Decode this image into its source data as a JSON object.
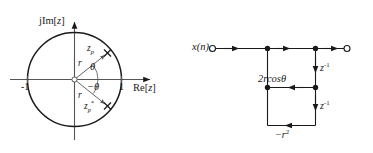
{
  "figure": {
    "background_color": "#ffffff",
    "stroke_color": "#1a1a1a"
  },
  "zplane": {
    "name": "z-plane pole plot",
    "axis_imag_label": "jIm[z]",
    "axis_real_label": "Re[z]",
    "tick_left_label": "-1",
    "tick_right_label": "1",
    "unit_circle_radius_label": "1",
    "pole_label": "z",
    "pole_subscript": "p",
    "conj_pole_label": "z",
    "conj_pole_subscript": "p",
    "conj_pole_superscript": "*",
    "radius_label_upper": "r",
    "radius_label_lower": "r",
    "angle_label_upper": "θ",
    "angle_label_lower": "−θ",
    "pole_marker": "pole-cross-marker",
    "origin_marker": "origin-open-circle"
  },
  "flowgraph": {
    "name": "second order IIR signal flow graph",
    "input_label": "x(n)",
    "input_terminal": "input-open-circle",
    "output_terminal": "output-open-circle",
    "coefficient_label": "2rcosθ",
    "delay_label_first": "z",
    "delay_exponent_first": "-1",
    "delay_label_second": "z",
    "delay_exponent_second": "-1",
    "feedback_label": "−r",
    "feedback_exponent": "2"
  }
}
